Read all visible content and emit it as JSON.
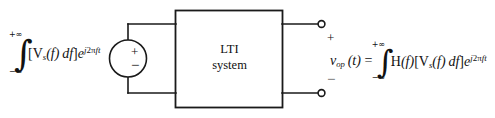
{
  "figure": {
    "background_color": "#ffffff",
    "line_color": "#1a1a1a"
  },
  "block": {
    "label_line1": "LTI",
    "label_line2": "system"
  },
  "source": {
    "plus_sign": "+",
    "minus_sign": "−"
  },
  "output_terminals": {
    "plus_sign": "+",
    "minus_sign": "−"
  },
  "input_expression": {
    "integral_sign": "∫",
    "upper_limit": "+∞",
    "lower_limit": "−∞",
    "bracket_open": "[",
    "v_symbol": "V",
    "v_subscript": "s",
    "of_f": "(f)",
    "differential": "df",
    "bracket_close": "]",
    "exp_base": "e",
    "exp_j": "j",
    "exp_two": "2",
    "exp_pi": "π",
    "exp_f": "f",
    "exp_t": "t"
  },
  "output_expression": {
    "v_symbol": "v",
    "v_subscript": "op",
    "of_t": "(t)",
    "equals": "=",
    "integral_sign": "∫",
    "upper_limit": "+∞",
    "lower_limit": "−∞",
    "h_symbol": "H",
    "h_of_f": "(f)",
    "bracket_open": "[",
    "v_symbol2": "V",
    "v_subscript2": "s",
    "of_f": "(f)",
    "differential": "df",
    "bracket_close": "]",
    "exp_base": "e",
    "exp_j": "j",
    "exp_two": "2",
    "exp_pi": "π",
    "exp_f": "f",
    "exp_t": "t"
  }
}
